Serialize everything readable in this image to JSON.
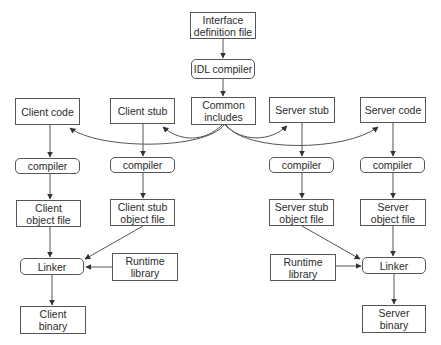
{
  "diagram": {
    "nodes": {
      "interface_definition_file": {
        "line1": "Interface",
        "line2": "definition file",
        "shape": "rect"
      },
      "idl_compiler": {
        "label": "IDL compiler",
        "shape": "rounded"
      },
      "client_code": {
        "label": "Client code",
        "shape": "rect"
      },
      "client_stub": {
        "label": "Client stub",
        "shape": "rect"
      },
      "common_includes": {
        "line1": "Common",
        "line2": "includes",
        "shape": "rect"
      },
      "server_stub": {
        "label": "Server stub",
        "shape": "rect"
      },
      "server_code": {
        "label": "Server code",
        "shape": "rect"
      },
      "client_compiler": {
        "label": "compiler",
        "shape": "rounded"
      },
      "client_stub_compiler": {
        "label": "compiler",
        "shape": "rounded"
      },
      "server_stub_compiler": {
        "label": "compiler",
        "shape": "rounded"
      },
      "server_compiler": {
        "label": "compiler",
        "shape": "rounded"
      },
      "client_object_file": {
        "line1": "Client",
        "line2": "object file",
        "shape": "rect"
      },
      "client_stub_object_file": {
        "line1": "Client stub",
        "line2": "object file",
        "shape": "rect"
      },
      "server_stub_object_file": {
        "line1": "Server stub",
        "line2": "object file",
        "shape": "rect"
      },
      "server_object_file": {
        "line1": "Server",
        "line2": "object file",
        "shape": "rect"
      },
      "client_linker": {
        "label": "Linker",
        "shape": "rounded"
      },
      "client_runtime_library": {
        "line1": "Runtime",
        "line2": "library",
        "shape": "rect"
      },
      "server_runtime_library": {
        "line1": "Runtime",
        "line2": "library",
        "shape": "rect"
      },
      "server_linker": {
        "label": "Linker",
        "shape": "rounded"
      },
      "client_binary": {
        "line1": "Client",
        "line2": "binary",
        "shape": "rect"
      },
      "server_binary": {
        "line1": "Server",
        "line2": "binary",
        "shape": "rect"
      }
    },
    "edges": [
      {
        "from": "Interface definition file",
        "to": "IDL compiler"
      },
      {
        "from": "IDL compiler",
        "to": "Common includes"
      },
      {
        "from": "Common includes",
        "to": "Client code",
        "style": "curved"
      },
      {
        "from": "Common includes",
        "to": "Client stub",
        "style": "curved"
      },
      {
        "from": "Common includes",
        "to": "Server stub",
        "style": "curved"
      },
      {
        "from": "Common includes",
        "to": "Server code",
        "style": "curved"
      },
      {
        "from": "Client code",
        "to": "compiler"
      },
      {
        "from": "Client stub",
        "to": "compiler"
      },
      {
        "from": "Server stub",
        "to": "compiler"
      },
      {
        "from": "Server code",
        "to": "compiler"
      },
      {
        "from": "compiler",
        "to": "Client object file"
      },
      {
        "from": "compiler",
        "to": "Client stub object file"
      },
      {
        "from": "compiler",
        "to": "Server stub object file"
      },
      {
        "from": "compiler",
        "to": "Server object file"
      },
      {
        "from": "Client object file",
        "to": "Linker"
      },
      {
        "from": "Client stub object file",
        "to": "Linker"
      },
      {
        "from": "Runtime library",
        "to": "Linker"
      },
      {
        "from": "Linker",
        "to": "Client binary"
      },
      {
        "from": "Server stub object file",
        "to": "Linker"
      },
      {
        "from": "Server object file",
        "to": "Linker"
      },
      {
        "from": "Runtime library",
        "to": "Linker"
      },
      {
        "from": "Linker",
        "to": "Server binary"
      }
    ],
    "colors": {
      "stroke": "#555555",
      "text": "#2b2b2b",
      "background": "#ffffff"
    }
  }
}
